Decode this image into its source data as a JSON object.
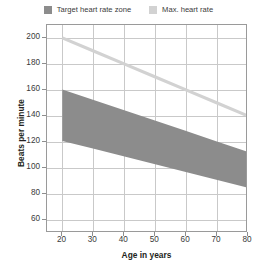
{
  "legend": {
    "items": [
      {
        "label": "Target heart rate zone",
        "color": "#8c8c8c",
        "swatch_icon": "square-swatch-icon"
      },
      {
        "label": "Max. heart rate",
        "color": "#d2d2d2",
        "swatch_icon": "square-swatch-icon"
      }
    ]
  },
  "axes": {
    "x_title": "Age in years",
    "y_title": "Beats per minute",
    "x_ticks": [
      20,
      30,
      40,
      50,
      60,
      70,
      80
    ],
    "y_ticks": [
      60,
      80,
      100,
      120,
      140,
      160,
      180,
      200
    ]
  },
  "chart_data": {
    "type": "line",
    "title": "",
    "subtitle": "",
    "xlabel": "Age in years",
    "ylabel": "Beats per minute",
    "xlim": [
      15,
      80
    ],
    "ylim": [
      50,
      210
    ],
    "xticks": [
      20,
      30,
      40,
      50,
      60,
      70,
      80
    ],
    "yticks": [
      60,
      80,
      100,
      120,
      140,
      160,
      180,
      200
    ],
    "grid": true,
    "legend_position": "top-center",
    "x": [
      20,
      30,
      40,
      50,
      60,
      70,
      80
    ],
    "series": [
      {
        "name": "Max. heart rate",
        "type": "line",
        "color": "#d2d2d2",
        "values": [
          200,
          190,
          180,
          170,
          160,
          150,
          140
        ]
      },
      {
        "name": "Target heart rate zone",
        "type": "band",
        "color": "#8c8c8c",
        "upper": [
          160,
          152,
          144,
          136,
          128,
          120,
          112
        ],
        "lower": [
          120,
          114,
          108,
          102,
          96,
          90,
          84
        ]
      }
    ],
    "annotations": []
  }
}
